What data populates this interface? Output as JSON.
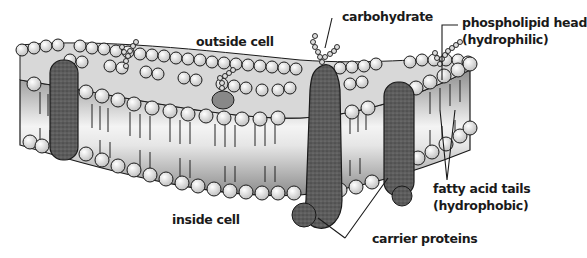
{
  "diagram": {
    "colors": {
      "background": "#ffffff",
      "outline": "#1a1a1a",
      "head_fill": "#e8e8e8",
      "protein_fill": "#555555",
      "band_light": "#f2f2f2",
      "band_dark": "#9a9a9a"
    },
    "labels": {
      "outside_cell": "outside cell",
      "carbohydrate": "carbohydrate",
      "phospholipid_head_line1": "phospholipid head",
      "phospholipid_head_line2": "(hydrophilic)",
      "fatty_acid_tails_line1": "fatty acid tails",
      "fatty_acid_tails_line2": "(hydrophobic)",
      "inside_cell": "inside cell",
      "carrier_proteins": "carrier proteins"
    }
  }
}
